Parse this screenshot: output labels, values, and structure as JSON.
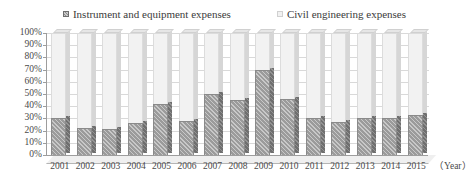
{
  "chart_data": {
    "type": "bar",
    "subtype": "100% stacked column (3D)",
    "title": "",
    "xlabel": "（Year）",
    "ylabel": "",
    "ylim": [
      0,
      100
    ],
    "y_unit": "%",
    "grid": true,
    "legend_position": "top-center",
    "categories": [
      "2001",
      "2002",
      "2003",
      "2004",
      "2005",
      "2006",
      "2007",
      "2008",
      "2009",
      "2010",
      "2011",
      "2012",
      "2013",
      "2014",
      "2015"
    ],
    "y_ticks": [
      "0%",
      "10%",
      "20%",
      "30%",
      "40%",
      "50%",
      "60%",
      "70%",
      "80%",
      "90%",
      "100%"
    ],
    "y_tick_values": [
      0,
      10,
      20,
      30,
      40,
      50,
      60,
      70,
      80,
      90,
      100
    ],
    "series": [
      {
        "name": "Instrument and equipment expenses",
        "color": "#9b9b9b",
        "pattern": "diagonal-hatch",
        "values": [
          30,
          22,
          21,
          26,
          42,
          28,
          50,
          45,
          70,
          46,
          30,
          27,
          30,
          30,
          33
        ]
      },
      {
        "name": "Civil engineering expenses",
        "color": "#f2f2f2",
        "pattern": "solid",
        "values": [
          70,
          78,
          79,
          74,
          58,
          72,
          50,
          55,
          30,
          54,
          70,
          73,
          70,
          70,
          67
        ]
      }
    ]
  },
  "legend": {
    "items": [
      {
        "label": "Instrument and equipment expenses",
        "swatch": "legend-swatch-instrument"
      },
      {
        "label": "Civil engineering expenses",
        "swatch": "legend-swatch-civil"
      }
    ]
  },
  "axis": {
    "unit_label": "（Year）"
  }
}
